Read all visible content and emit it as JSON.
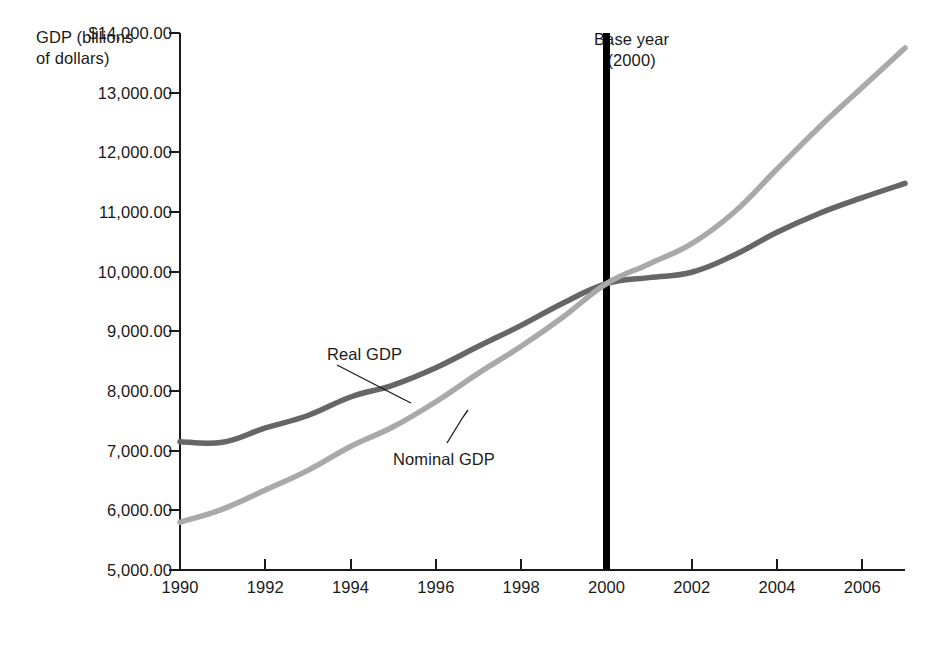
{
  "chart_data": {
    "type": "line",
    "title": "",
    "ylabel": "GDP (billions\nof dollars)",
    "xlabel": "",
    "grid": false,
    "legend_position": "inline-annotations",
    "xlim": [
      1990,
      2007
    ],
    "ylim": [
      5000,
      14000
    ],
    "x": [
      1990,
      1991,
      1992,
      1993,
      1994,
      1995,
      1996,
      1997,
      1998,
      1999,
      2000,
      2001,
      2002,
      2003,
      2004,
      2005,
      2006,
      2007
    ],
    "xticks": [
      "1990",
      "1992",
      "1994",
      "1996",
      "1998",
      "2000",
      "2002",
      "2004",
      "2006"
    ],
    "xtick_values": [
      1990,
      1992,
      1994,
      1996,
      1998,
      2000,
      2002,
      2004,
      2006
    ],
    "yticks": [
      "$14,000.00",
      "13,000.00",
      "12,000.00",
      "11,000.00",
      "10,000.00",
      "9,000.00",
      "8,000.00",
      "7,000.00",
      "6,000.00",
      "5,000.00"
    ],
    "ytick_values": [
      14000,
      13000,
      12000,
      11000,
      10000,
      9000,
      8000,
      7000,
      6000,
      5000
    ],
    "series": [
      {
        "name": "Real GDP",
        "color": "#666666",
        "values": [
          7150,
          7140,
          7380,
          7590,
          7900,
          8100,
          8390,
          8750,
          9100,
          9480,
          9800,
          9900,
          9990,
          10280,
          10660,
          10980,
          11240,
          11480
        ]
      },
      {
        "name": "Nominal GDP",
        "color": "#a9a9a9",
        "values": [
          5800,
          6020,
          6340,
          6670,
          7070,
          7400,
          7820,
          8300,
          8750,
          9250,
          9800,
          10130,
          10470,
          11000,
          11720,
          12430,
          13090,
          13750
        ]
      }
    ],
    "annotations": [
      {
        "id": "base-year",
        "text": "Base year\n(2000)",
        "kind": "vertical-rule-label",
        "x": 2000,
        "color": "#000000"
      },
      {
        "id": "real-gdp-label",
        "text": "Real GDP",
        "kind": "leader-line-label",
        "series": "Real GDP"
      },
      {
        "id": "nominal-gdp-label",
        "text": "Nominal GDP",
        "kind": "leader-line-label",
        "series": "Nominal GDP"
      }
    ],
    "axis_color": "#1a1a1a",
    "background": "#ffffff"
  }
}
